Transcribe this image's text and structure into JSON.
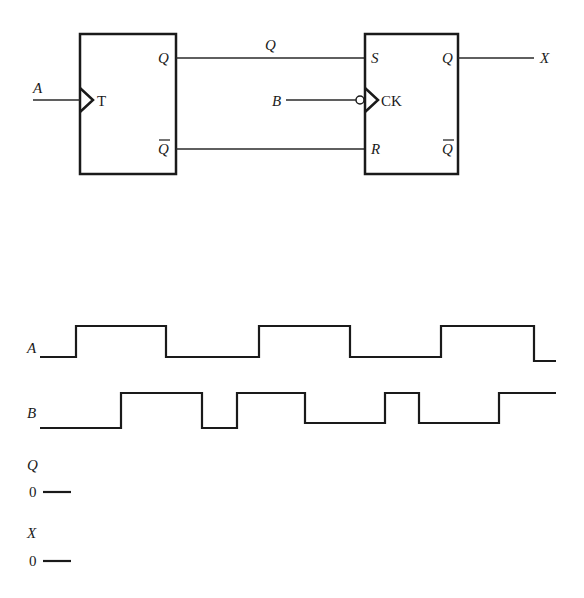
{
  "circuit": {
    "t_flipflop": {
      "clock_label": "T",
      "q_label": "Q",
      "qbar_label": "Q",
      "input_label": "A"
    },
    "sr_flipflop": {
      "s_label": "S",
      "r_label": "R",
      "clock_label": "CK",
      "q_label": "Q",
      "qbar_label": "Q",
      "clock_input_label": "B",
      "output_label": "X",
      "clock_inverted": true
    },
    "wire_q_label": "Q"
  },
  "timing": {
    "signals": [
      {
        "name": "A",
        "initial": 0,
        "transitions_x": [
          76,
          166,
          259,
          350,
          441,
          534
        ],
        "end_x": 556
      },
      {
        "name": "B",
        "initial": 0,
        "transitions_x": [
          121,
          202,
          237,
          305,
          385,
          419,
          499
        ],
        "end_x": 556
      },
      {
        "name": "Q",
        "initial_label": "0"
      },
      {
        "name": "X",
        "initial_label": "0"
      }
    ]
  }
}
